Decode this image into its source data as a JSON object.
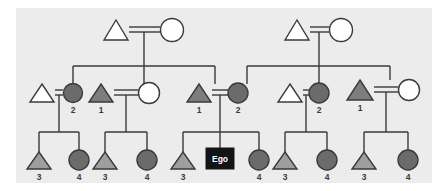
{
  "diagram": {
    "type": "pedigree",
    "background_color": "#ececec",
    "page_color": "#ffffff",
    "line_color": "#3a3a3a",
    "colors": {
      "unfilled": "#ffffff",
      "light_shaded": "#9e9e9e",
      "mid_shaded": "#7d7d7d",
      "dark_shaded": "#6b6b6b",
      "ego_box": "#141414",
      "ego_text": "#ffffff",
      "outline": "#3a3a3a",
      "label_text": "#3a3a3a"
    },
    "legend_notes": {
      "triangle": "male",
      "circle": "female",
      "double_line": "marriage",
      "square_black": "ego"
    }
  },
  "generations": [
    {
      "id": "gen1",
      "label": "generation-1",
      "couples": [
        {
          "id": "g1-couple-left",
          "male": {
            "shape": "triangle",
            "fill": "unfilled",
            "label": ""
          },
          "female": {
            "shape": "circle",
            "fill": "unfilled",
            "label": ""
          }
        },
        {
          "id": "g1-couple-right",
          "male": {
            "shape": "triangle",
            "fill": "unfilled",
            "label": ""
          },
          "female": {
            "shape": "circle",
            "fill": "unfilled",
            "label": ""
          }
        }
      ]
    },
    {
      "id": "gen2",
      "label": "generation-2",
      "persons": [
        {
          "id": "g2-p1",
          "shape": "triangle",
          "fill": "unfilled",
          "label": "",
          "married_in": true
        },
        {
          "id": "g2-p2",
          "shape": "circle",
          "fill": "dark_shaded",
          "label": "2",
          "married_in": false
        },
        {
          "id": "g2-p3",
          "shape": "triangle",
          "fill": "mid_shaded",
          "label": "1",
          "married_in": false
        },
        {
          "id": "g2-p4",
          "shape": "circle",
          "fill": "unfilled",
          "label": "",
          "married_in": true
        },
        {
          "id": "g2-p5",
          "shape": "triangle",
          "fill": "mid_shaded",
          "label": "1",
          "married_in": false
        },
        {
          "id": "g2-p6",
          "shape": "circle",
          "fill": "dark_shaded",
          "label": "2",
          "married_in": false
        },
        {
          "id": "g2-p7",
          "shape": "triangle",
          "fill": "unfilled",
          "label": "",
          "married_in": true
        },
        {
          "id": "g2-p8",
          "shape": "circle",
          "fill": "dark_shaded",
          "label": "2",
          "married_in": false
        },
        {
          "id": "g2-p9",
          "shape": "triangle",
          "fill": "mid_shaded",
          "label": "1",
          "married_in": false
        },
        {
          "id": "g2-p10",
          "shape": "circle",
          "fill": "unfilled",
          "label": "",
          "married_in": true
        }
      ]
    },
    {
      "id": "gen3",
      "label": "generation-3",
      "persons": [
        {
          "id": "g3-p1",
          "shape": "triangle",
          "fill": "light_shaded",
          "label": "3"
        },
        {
          "id": "g3-p2",
          "shape": "circle",
          "fill": "dark_shaded",
          "label": "4"
        },
        {
          "id": "g3-p3",
          "shape": "triangle",
          "fill": "light_shaded",
          "label": "3"
        },
        {
          "id": "g3-p4",
          "shape": "circle",
          "fill": "dark_shaded",
          "label": "4"
        },
        {
          "id": "g3-p5",
          "shape": "triangle",
          "fill": "light_shaded",
          "label": "3"
        },
        {
          "id": "g3-ego",
          "shape": "square",
          "fill": "ego_box",
          "label": "Ego"
        },
        {
          "id": "g3-p7",
          "shape": "circle",
          "fill": "dark_shaded",
          "label": "4"
        },
        {
          "id": "g3-p8",
          "shape": "triangle",
          "fill": "light_shaded",
          "label": "3"
        },
        {
          "id": "g3-p9",
          "shape": "circle",
          "fill": "dark_shaded",
          "label": "4"
        },
        {
          "id": "g3-p10",
          "shape": "triangle",
          "fill": "light_shaded",
          "label": "3"
        },
        {
          "id": "g3-p11",
          "shape": "circle",
          "fill": "dark_shaded",
          "label": "4"
        }
      ]
    }
  ],
  "labels": {
    "ego": "Ego",
    "n1": "1",
    "n2": "2",
    "n3": "3",
    "n4": "4"
  }
}
